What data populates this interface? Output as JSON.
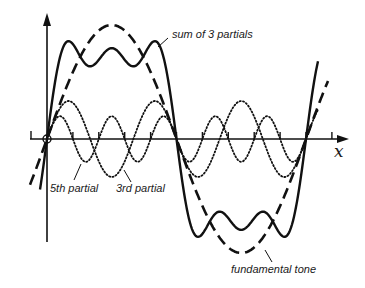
{
  "diagram": {
    "axis": {
      "x_label": "x"
    },
    "labels": {
      "sum": "sum of 3 partials",
      "fifth": "5th partial",
      "third": "3rd partial",
      "fundamental": "fundamental tone"
    },
    "curves": [
      {
        "name": "fundamental tone",
        "style": "dashed",
        "harmonic": 1
      },
      {
        "name": "3rd partial",
        "style": "dotted",
        "harmonic": 3
      },
      {
        "name": "5th partial",
        "style": "dotted",
        "harmonic": 5
      },
      {
        "name": "sum of 3 partials",
        "style": "solid"
      }
    ],
    "colors": {
      "ink": "#111111",
      "background": "#ffffff"
    }
  }
}
